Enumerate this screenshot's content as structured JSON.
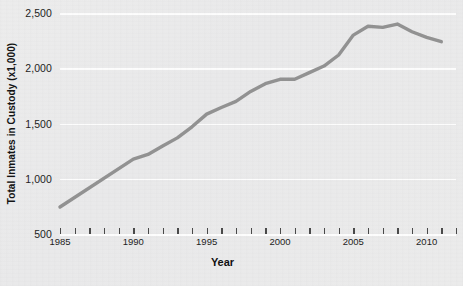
{
  "chart_data": {
    "type": "line",
    "title": "",
    "xlabel": "Year",
    "ylabel": "Total Inmates in Custody (x1,000)",
    "xlim": [
      1985,
      2012
    ],
    "ylim": [
      500,
      2500
    ],
    "grid": true,
    "legend_position": "none",
    "y_ticks": [
      "2,500",
      "2,000",
      "1,500",
      "1,000",
      "500"
    ],
    "y_tick_values": [
      2500,
      2000,
      1500,
      1000,
      500
    ],
    "x_tick_labels": [
      "1985",
      "1990",
      "1995",
      "2000",
      "2005",
      "2010"
    ],
    "x_tick_label_values": [
      1985,
      1990,
      1995,
      2000,
      2005,
      2010
    ],
    "x_minor_tick_values": [
      1985,
      1986,
      1987,
      1988,
      1989,
      1990,
      1991,
      1992,
      1993,
      1994,
      1995,
      1996,
      1997,
      1998,
      1999,
      2000,
      2001,
      2002,
      2003,
      2004,
      2005,
      2006,
      2007,
      2008,
      2009,
      2010,
      2011,
      2012
    ],
    "line_color": "#8d8d8d",
    "background_color": "#ececec",
    "gridline_color": "#fdfdfd",
    "series": [
      {
        "name": "Total Inmates in Custody",
        "x": [
          1985,
          1990,
          1991,
          1992,
          1993,
          1994,
          1995,
          1996,
          1997,
          1998,
          1999,
          2000,
          2001,
          2002,
          2003,
          2004,
          2005,
          2006,
          2007,
          2008,
          2009,
          2010,
          2011
        ],
        "values": [
          744,
          1178,
          1220,
          1296,
          1370,
          1470,
          1585,
          1645,
          1700,
          1790,
          1860,
          1900,
          1900,
          1960,
          2020,
          2120,
          2300,
          2380,
          2370,
          2400,
          2330,
          2280,
          2240
        ]
      }
    ]
  },
  "axes": {
    "y_title": "Total Inmates in Custody (x1,000)",
    "x_title": "Year"
  }
}
